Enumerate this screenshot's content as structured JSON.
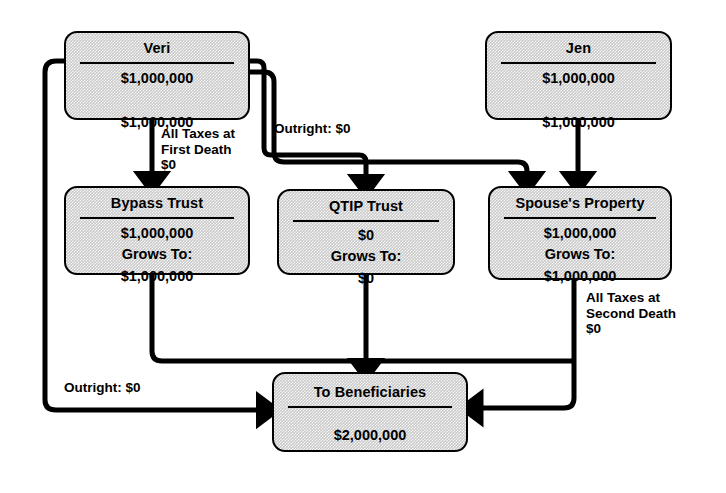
{
  "diagram": {
    "line_color": "#000000",
    "box_fill": "#c9c9c9",
    "box_border": "#000000"
  },
  "nodes": {
    "veri": {
      "title": "Veri",
      "amount_top": "$1,000,000",
      "amount_bottom": "$1,000,000"
    },
    "jen": {
      "title": "Jen",
      "amount_top": "$1,000,000",
      "amount_bottom": "$1,000,000"
    },
    "bypass": {
      "title": "Bypass Trust",
      "amount_top": "$1,000,000",
      "grows_label": "Grows To:",
      "amount_bottom": "$1,000,000"
    },
    "qtip": {
      "title": "QTIP Trust",
      "amount_top": "$0",
      "grows_label": "Grows To:",
      "amount_bottom": "$0"
    },
    "spouse": {
      "title": "Spouse's Property",
      "amount_top": "$1,000,000",
      "grows_label": "Grows To:",
      "amount_bottom": "$1,000,000"
    },
    "beneficiaries": {
      "title": "To Beneficiaries",
      "amount": "$2,000,000"
    }
  },
  "annotations": {
    "first_death": "All Taxes at\nFirst Death\n$0",
    "outright_top": "Outright: $0",
    "second_death": "All Taxes at\nSecond Death\n$0",
    "outright_bottom": "Outright: $0"
  }
}
